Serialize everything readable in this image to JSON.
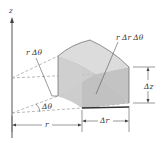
{
  "diagram": {
    "labels": {
      "z_axis": "z",
      "arc_length": "r Δθ",
      "volume": "r Δr Δθ",
      "height": "Δz",
      "angle": "Δθ",
      "radius": "r",
      "radial_width": "Δr"
    },
    "colors": {
      "line": "#444444",
      "dashed": "#9a9a9a",
      "face_top": "#d9d9d9",
      "face_front": "#c8c8c8",
      "face_side": "#bdbdbd",
      "face_bottom": "#a8a8a8",
      "text": "#333333"
    }
  }
}
